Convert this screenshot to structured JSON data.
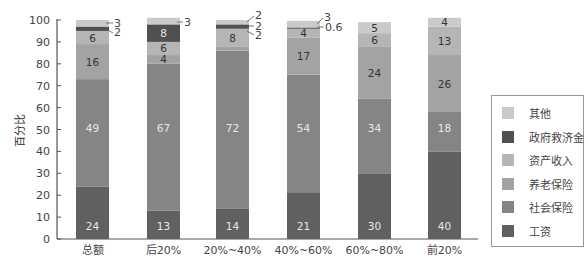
{
  "chart_data": {
    "type": "bar",
    "stacked": true,
    "title": "",
    "xlabel": "",
    "ylabel": "百分比",
    "ylim": [
      0,
      100
    ],
    "yticks": [
      0,
      10,
      20,
      30,
      40,
      50,
      60,
      70,
      80,
      90,
      100
    ],
    "grid": false,
    "legend_position": "right",
    "categories": [
      "总额",
      "后20%",
      "20%~40%",
      "40%~60%",
      "60%~80%",
      "前20%"
    ],
    "series": [
      {
        "name": "工资",
        "color": "#606060",
        "values": [
          24,
          13,
          14,
          21,
          30,
          40
        ]
      },
      {
        "name": "社会保险",
        "color": "#858585",
        "values": [
          49,
          67,
          72,
          54,
          34,
          18
        ]
      },
      {
        "name": "养老保险",
        "color": "#a3a3a3",
        "values": [
          16,
          4,
          2,
          17,
          24,
          26
        ]
      },
      {
        "name": "资产收入",
        "color": "#b5b5b5",
        "values": [
          6,
          6,
          8,
          4,
          6,
          13
        ]
      },
      {
        "name": "政府救济金",
        "color": "#505050",
        "values": [
          2,
          8,
          2,
          0.6,
          0,
          0
        ]
      },
      {
        "name": "其他",
        "color": "#cacaca",
        "values": [
          3,
          3,
          2,
          3,
          5,
          4
        ]
      }
    ],
    "labels": [
      [
        "24",
        "49",
        "16",
        "6",
        "2",
        "3"
      ],
      [
        "13",
        "67",
        "4",
        "6",
        "8",
        "3"
      ],
      [
        "14",
        "72",
        "2",
        "8",
        "2",
        "2"
      ],
      [
        "21",
        "54",
        "17",
        "4",
        "0.6",
        "3"
      ],
      [
        "30",
        "34",
        "24",
        "6",
        "",
        "5"
      ],
      [
        "40",
        "18",
        "26",
        "13",
        "",
        "4"
      ]
    ]
  },
  "legend": {
    "items": [
      {
        "label": "其他",
        "color": "#cacaca"
      },
      {
        "label": "政府救济金",
        "color": "#505050"
      },
      {
        "label": "资产收入",
        "color": "#b5b5b5"
      },
      {
        "label": "养老保险",
        "color": "#a3a3a3"
      },
      {
        "label": "社会保险",
        "color": "#858585"
      },
      {
        "label": "工资",
        "color": "#606060"
      }
    ]
  }
}
